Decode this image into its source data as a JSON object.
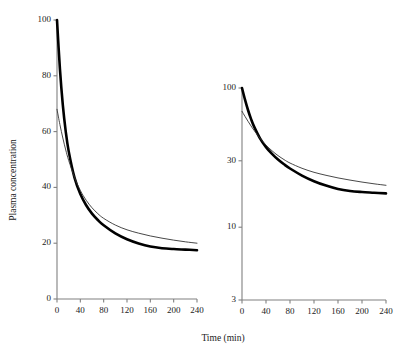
{
  "figure": {
    "background": "#ffffff",
    "axis_color": "#808080",
    "curve_thick_color": "#000000",
    "curve_thin_color": "#333333"
  },
  "axis_titles": {
    "x": "Time (min)",
    "y": "Plasma concentration"
  },
  "chart_data": [
    {
      "type": "line",
      "title": "",
      "panel": "left-linear",
      "xlabel": "Time (min)",
      "ylabel": "Plasma concentration",
      "xlim": [
        0,
        240
      ],
      "ylim": [
        0,
        100
      ],
      "yscale": "linear",
      "grid": false,
      "legend": "none",
      "xticks": [
        0,
        40,
        80,
        120,
        160,
        200,
        240
      ],
      "xticklabels": [
        "0",
        "40",
        "80",
        "120",
        "160",
        "200",
        "240"
      ],
      "yticks": [
        0,
        20,
        40,
        60,
        80,
        100
      ],
      "yticklabels": [
        "0",
        "20",
        "40",
        "60",
        "80",
        "100"
      ],
      "x": [
        0,
        5,
        10,
        15,
        20,
        30,
        40,
        50,
        60,
        70,
        80,
        100,
        120,
        140,
        160,
        180,
        200,
        220,
        240
      ],
      "series": [
        {
          "name": "two-compartment model",
          "style": "thick",
          "linewidth": 2.6,
          "values": [
            100,
            82.5,
            69.5,
            60.0,
            53.0,
            43.5,
            37.6,
            33.6,
            30.6,
            28.3,
            26.4,
            23.5,
            21.4,
            19.9,
            18.8,
            18.2,
            17.9,
            17.7,
            17.5
          ]
        },
        {
          "name": "one-compartment model",
          "style": "thin",
          "linewidth": 0.9,
          "values": [
            68.0,
            62.5,
            57.7,
            53.4,
            49.7,
            43.6,
            38.9,
            35.4,
            32.7,
            30.6,
            28.9,
            26.5,
            24.8,
            23.6,
            22.6,
            21.8,
            21.1,
            20.5,
            20.0
          ]
        }
      ]
    },
    {
      "type": "line",
      "title": "",
      "panel": "right-semilog",
      "xlabel": "Time (min)",
      "ylabel": "",
      "xlim": [
        0,
        240
      ],
      "ylim": [
        3,
        100
      ],
      "yscale": "log",
      "grid": false,
      "legend": "none",
      "xticks": [
        0,
        40,
        80,
        120,
        160,
        200,
        240
      ],
      "xticklabels": [
        "0",
        "40",
        "80",
        "120",
        "160",
        "200",
        "240"
      ],
      "yticks": [
        3,
        10,
        30,
        100
      ],
      "yticklabels": [
        "3",
        "10",
        "30",
        "100"
      ],
      "x": [
        0,
        5,
        10,
        15,
        20,
        30,
        40,
        50,
        60,
        70,
        80,
        100,
        120,
        140,
        160,
        180,
        200,
        220,
        240
      ],
      "series": [
        {
          "name": "two-compartment model",
          "style": "thick",
          "linewidth": 2.6,
          "values": [
            100,
            82.5,
            69.5,
            60.0,
            53.0,
            43.5,
            37.6,
            33.6,
            30.6,
            28.3,
            26.4,
            23.5,
            21.4,
            19.9,
            18.8,
            18.2,
            17.9,
            17.7,
            17.5
          ]
        },
        {
          "name": "one-compartment model",
          "style": "thin",
          "linewidth": 0.9,
          "values": [
            68.0,
            62.5,
            57.7,
            53.4,
            49.7,
            43.6,
            38.9,
            35.4,
            32.7,
            30.6,
            28.9,
            26.5,
            24.8,
            23.6,
            22.6,
            21.8,
            21.1,
            20.5,
            20.0
          ]
        }
      ]
    }
  ]
}
